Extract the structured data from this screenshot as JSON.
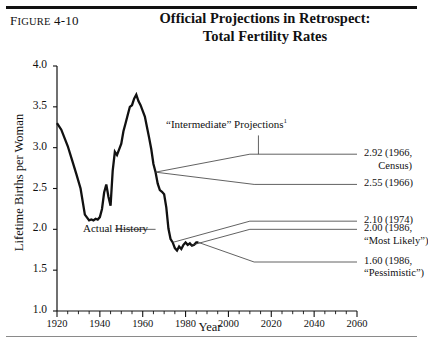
{
  "figure": {
    "number_prefix": "F",
    "number_rest": "IGURE",
    "number": "4-10",
    "title_line1": "Official Projections in Retrospect:",
    "title_line2": "Total Fertility Rates"
  },
  "annotations": {
    "projections_label": "“Intermediate” Projections",
    "projections_footnote": "1",
    "actual_history": "Actual History"
  },
  "right_labels": [
    {
      "id": "label-2-92",
      "line1": "2.92 (1966,",
      "line2": "Census)",
      "value": 2.92,
      "year": 1966,
      "source": "Census"
    },
    {
      "id": "label-2-55",
      "line1": "2.55 (1966)",
      "line2": "",
      "value": 2.55,
      "year": 1966,
      "source": ""
    },
    {
      "id": "label-2-10",
      "line1": "2.10 (1974)",
      "line2": "",
      "value": 2.1,
      "year": 1974,
      "source": ""
    },
    {
      "id": "label-2-00",
      "line1": "2.00 (1986,",
      "line2": "“Most Likely”)",
      "value": 2.0,
      "year": 1986,
      "source": "Most Likely"
    },
    {
      "id": "label-1-60",
      "line1": "1.60 (1986,",
      "line2": "“Pessimistic”)",
      "value": 1.6,
      "year": 1986,
      "source": "Pessimistic"
    }
  ],
  "chart_data": {
    "type": "line",
    "title": "Official Projections in Retrospect: Total Fertility Rates",
    "xlabel": "Year",
    "ylabel": "Lifetime Births per Woman",
    "xlim": [
      1920,
      2060
    ],
    "ylim": [
      1.0,
      4.0
    ],
    "ytick_labels": [
      "1.0",
      "1.5",
      "2.0",
      "2.5",
      "3.0",
      "3.5",
      "4.0"
    ],
    "yticks": [
      1.0,
      1.5,
      2.0,
      2.5,
      3.0,
      3.5,
      4.0
    ],
    "xtick_labels": [
      "1920",
      "1940",
      "1960",
      "1980",
      "2000",
      "2020",
      "2040",
      "2060"
    ],
    "xticks": [
      1920,
      1940,
      1960,
      1980,
      2000,
      2020,
      2040,
      2060
    ],
    "xminor_step": 5,
    "grid": false,
    "legend": "none",
    "series": [
      {
        "name": "Actual History",
        "style": "thick",
        "x": [
          1920,
          1922,
          1925,
          1927,
          1929,
          1931,
          1933,
          1935,
          1936,
          1937,
          1938,
          1939,
          1940,
          1941,
          1942,
          1943,
          1944,
          1945,
          1946,
          1947,
          1948,
          1949,
          1950,
          1951,
          1952,
          1953,
          1954,
          1955,
          1956,
          1957,
          1958,
          1959,
          1960,
          1961,
          1962,
          1963,
          1964,
          1965,
          1966,
          1967,
          1968,
          1969,
          1970,
          1971,
          1972,
          1973,
          1974,
          1975,
          1976,
          1977,
          1978,
          1979,
          1980,
          1981,
          1982,
          1983,
          1984,
          1985,
          1986
        ],
        "y": [
          3.3,
          3.22,
          3.02,
          2.85,
          2.68,
          2.5,
          2.18,
          2.11,
          2.12,
          2.11,
          2.13,
          2.12,
          2.15,
          2.25,
          2.45,
          2.55,
          2.4,
          2.29,
          2.72,
          2.95,
          2.91,
          2.98,
          3.05,
          3.2,
          3.3,
          3.4,
          3.5,
          3.52,
          3.6,
          3.65,
          3.57,
          3.52,
          3.45,
          3.38,
          3.25,
          3.12,
          2.98,
          2.8,
          2.7,
          2.56,
          2.48,
          2.46,
          2.43,
          2.27,
          2.01,
          1.88,
          1.84,
          1.77,
          1.74,
          1.79,
          1.76,
          1.81,
          1.84,
          1.81,
          1.83,
          1.8,
          1.81,
          1.84,
          1.84
        ]
      },
      {
        "name": "2.92 (1966, Census) projection",
        "style": "thin",
        "x": [
          1966,
          2010,
          2060
        ],
        "y": [
          2.7,
          2.92,
          2.92
        ]
      },
      {
        "name": "2.55 (1966) projection",
        "style": "thin",
        "x": [
          1966,
          2012,
          2060
        ],
        "y": [
          2.7,
          2.55,
          2.55
        ]
      },
      {
        "name": "2.10 (1974) projection",
        "style": "thin",
        "x": [
          1974,
          2010,
          2060
        ],
        "y": [
          1.84,
          2.1,
          2.1
        ]
      },
      {
        "name": "2.00 (1986, Most Likely) projection",
        "style": "thin",
        "x": [
          1982,
          2010,
          2060
        ],
        "y": [
          1.8,
          2.0,
          2.0
        ]
      },
      {
        "name": "1.60 (1986, Pessimistic) projection",
        "style": "thin",
        "x": [
          1986,
          2012,
          2060
        ],
        "y": [
          1.84,
          1.6,
          1.6
        ]
      }
    ],
    "leader_lines": [
      {
        "name": "actual-history-leader",
        "x1": 1947,
        "y1": 2.0,
        "x2": 1966,
        "y2": 2.0
      },
      {
        "name": "projections-label-leader",
        "x1": 2014,
        "y1": 3.15,
        "x2": 2014,
        "y2": 2.92
      }
    ]
  },
  "colors": {
    "ink": "#111111",
    "rule": "#111111",
    "thin_line": "#3a3a3a",
    "background": "#ffffff"
  }
}
